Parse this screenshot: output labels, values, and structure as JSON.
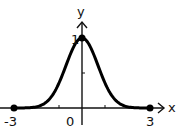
{
  "chart_data": {
    "type": "line",
    "title": "",
    "xlabel": "x",
    "ylabel": "y",
    "function": "y = e^(-x^2) (bell curve)",
    "x": [
      -3,
      -2.5,
      -2,
      -1.5,
      -1,
      -0.5,
      0,
      0.5,
      1,
      1.5,
      2,
      2.5,
      3
    ],
    "values": [
      0.0001,
      0.002,
      0.018,
      0.105,
      0.368,
      0.779,
      1.0,
      0.779,
      0.368,
      0.105,
      0.018,
      0.002,
      0.0001
    ],
    "xlim": [
      -3,
      3
    ],
    "ylim": [
      0,
      1
    ],
    "x_tick_labels": [
      "-3",
      "0",
      "3"
    ],
    "y_tick_labels": [
      "1"
    ],
    "marked_points": [
      {
        "x": -3,
        "y": 0
      },
      {
        "x": 0,
        "y": 1
      },
      {
        "x": 3,
        "y": 0
      }
    ],
    "grid": false,
    "legend": null
  },
  "labels": {
    "x_axis": "x",
    "y_axis": "y",
    "x_min": "-3",
    "x_zero": "0",
    "x_max": "3",
    "y_one": "1"
  }
}
